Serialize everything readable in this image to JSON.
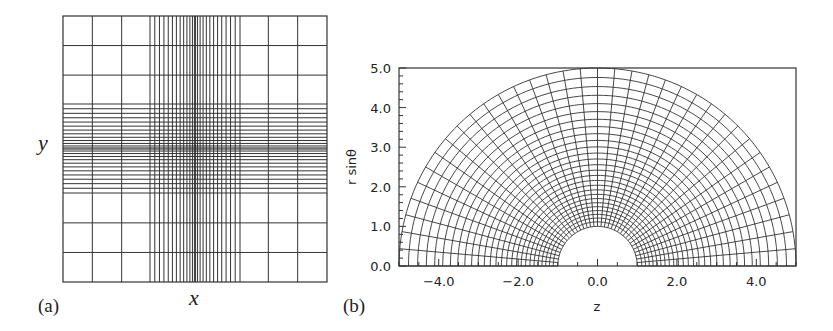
{
  "figure": {
    "panel_a": {
      "label": "(a)",
      "xlabel": "x",
      "ylabel": "y",
      "box": {
        "x0": 63,
        "y0": 16,
        "x1": 327,
        "y1": 282
      },
      "coarse_cells": 9,
      "dense_vertical": {
        "from": 150,
        "to": 240,
        "count": 26
      },
      "dense_horizontal": {
        "from": 104,
        "to": 193,
        "count": 26
      },
      "line_color": "#333333"
    },
    "panel_b": {
      "label": "(b)",
      "xlabel": "z",
      "ylabel": "r sinθ",
      "frame": {
        "x0": 399,
        "y0": 68,
        "x1": 796,
        "y1": 266
      },
      "xlim": [
        -5,
        5
      ],
      "ylim": [
        0,
        5
      ],
      "xticks": [
        "-4.0",
        "-2.0",
        "0.0",
        "2.0",
        "4.0"
      ],
      "xtick_values": [
        -4,
        -2,
        0,
        2,
        4
      ],
      "yticks": [
        "0.0",
        "1.0",
        "2.0",
        "3.0",
        "4.0",
        "5.0"
      ],
      "ytick_values": [
        0,
        1,
        2,
        3,
        4,
        5
      ],
      "inner_radius": 1.0,
      "outer_radius": 5.0,
      "radial_lines": 37,
      "rings": 28,
      "line_color": "#333333"
    }
  },
  "chart_data": [
    {
      "type": "mesh",
      "title": "(a) Cartesian grid with refinement",
      "xlabel": "x",
      "ylabel": "y",
      "description": "Square Cartesian grid, 9x9 coarse cells with dense refinement bands centered in both x and y"
    },
    {
      "type": "mesh",
      "title": "(b) Polar grid (r, θ)",
      "xlabel": "z",
      "ylabel": "r sinθ",
      "xlim": [
        -5,
        5
      ],
      "ylim": [
        0,
        5
      ],
      "x_ticks": [
        -4.0,
        -2.0,
        0.0,
        2.0,
        4.0
      ],
      "y_ticks": [
        0.0,
        1.0,
        2.0,
        3.0,
        4.0,
        5.0
      ],
      "r_range": [
        1.0,
        5.0
      ],
      "theta_range_deg": [
        0,
        180
      ]
    }
  ]
}
